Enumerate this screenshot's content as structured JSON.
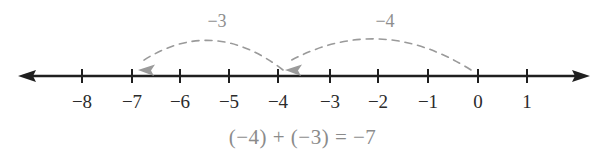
{
  "figure": {
    "kind": "number-line-addition-diagram",
    "axis": {
      "line_color": "#1f1f1f",
      "left_arrow_x": 18,
      "right_arrow_x": 590,
      "y": 76,
      "tick_half_height": 7
    },
    "ticks": [
      {
        "label": "−8",
        "value": -8,
        "x": 82
      },
      {
        "label": "−7",
        "value": -7,
        "x": 132
      },
      {
        "label": "−6",
        "value": -6,
        "x": 180
      },
      {
        "label": "−5",
        "value": -5,
        "x": 229
      },
      {
        "label": "−4",
        "value": -4,
        "x": 278
      },
      {
        "label": "−3",
        "value": -3,
        "x": 330
      },
      {
        "label": "−2",
        "value": -2,
        "x": 378
      },
      {
        "label": "−1",
        "value": -1,
        "x": 428
      },
      {
        "label": "0",
        "value": 0,
        "x": 478
      },
      {
        "label": "1",
        "value": 1,
        "x": 527
      }
    ],
    "tick_label_y": 92,
    "jumps": [
      {
        "name": "first-jump",
        "label": "−4",
        "from_value": 0,
        "to_value": -4,
        "from_x": 471,
        "to_x": 288,
        "apex_y": 30,
        "label_x": 385,
        "label_y": 12,
        "color": "#9a9a9a"
      },
      {
        "name": "second-jump",
        "label": "−3",
        "from_value": -4,
        "to_value": -7,
        "from_x": 283,
        "to_x": 141,
        "apex_y": 33,
        "label_x": 217,
        "label_y": 12,
        "color": "#9a9a9a"
      }
    ],
    "equation": "(−4) + (−3) = −7",
    "equation_color": "#8b8b8b"
  }
}
